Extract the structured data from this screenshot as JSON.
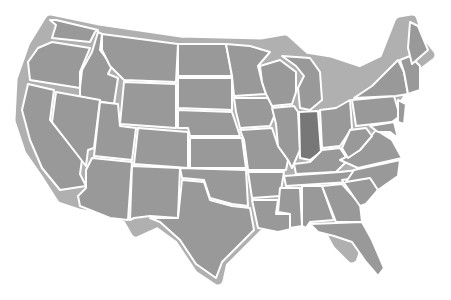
{
  "map": {
    "title": "United States map",
    "highlighted_state": "Indiana",
    "colors": {
      "background": "#ffffff",
      "outline_halo": "#b0b0b0",
      "state_fill": "#999999",
      "highlight_fill": "#777777",
      "border": "#ffffff"
    },
    "states": [
      {
        "id": "WA",
        "name": "Washington"
      },
      {
        "id": "OR",
        "name": "Oregon"
      },
      {
        "id": "CA",
        "name": "California"
      },
      {
        "id": "ID",
        "name": "Idaho"
      },
      {
        "id": "NV",
        "name": "Nevada"
      },
      {
        "id": "MT",
        "name": "Montana"
      },
      {
        "id": "WY",
        "name": "Wyoming"
      },
      {
        "id": "UT",
        "name": "Utah"
      },
      {
        "id": "AZ",
        "name": "Arizona"
      },
      {
        "id": "CO",
        "name": "Colorado"
      },
      {
        "id": "NM",
        "name": "New Mexico"
      },
      {
        "id": "ND",
        "name": "North Dakota"
      },
      {
        "id": "SD",
        "name": "South Dakota"
      },
      {
        "id": "NE",
        "name": "Nebraska"
      },
      {
        "id": "KS",
        "name": "Kansas"
      },
      {
        "id": "OK",
        "name": "Oklahoma"
      },
      {
        "id": "TX",
        "name": "Texas"
      },
      {
        "id": "MN",
        "name": "Minnesota"
      },
      {
        "id": "IA",
        "name": "Iowa"
      },
      {
        "id": "MO",
        "name": "Missouri"
      },
      {
        "id": "AR",
        "name": "Arkansas"
      },
      {
        "id": "LA",
        "name": "Louisiana"
      },
      {
        "id": "WI",
        "name": "Wisconsin"
      },
      {
        "id": "IL",
        "name": "Illinois"
      },
      {
        "id": "MI",
        "name": "Michigan"
      },
      {
        "id": "IN",
        "name": "Indiana",
        "highlighted": true
      },
      {
        "id": "OH",
        "name": "Ohio"
      },
      {
        "id": "KY",
        "name": "Kentucky"
      },
      {
        "id": "TN",
        "name": "Tennessee"
      },
      {
        "id": "MS",
        "name": "Mississippi"
      },
      {
        "id": "AL",
        "name": "Alabama"
      },
      {
        "id": "GA",
        "name": "Georgia"
      },
      {
        "id": "FL",
        "name": "Florida"
      },
      {
        "id": "SC",
        "name": "South Carolina"
      },
      {
        "id": "NC",
        "name": "North Carolina"
      },
      {
        "id": "VA",
        "name": "Virginia"
      },
      {
        "id": "WV",
        "name": "West Virginia"
      },
      {
        "id": "PA",
        "name": "Pennsylvania"
      },
      {
        "id": "NY",
        "name": "New York"
      },
      {
        "id": "ME",
        "name": "Maine"
      },
      {
        "id": "NEng",
        "name": "New England"
      },
      {
        "id": "MD",
        "name": "Maryland"
      },
      {
        "id": "NJ",
        "name": "New Jersey"
      }
    ]
  }
}
